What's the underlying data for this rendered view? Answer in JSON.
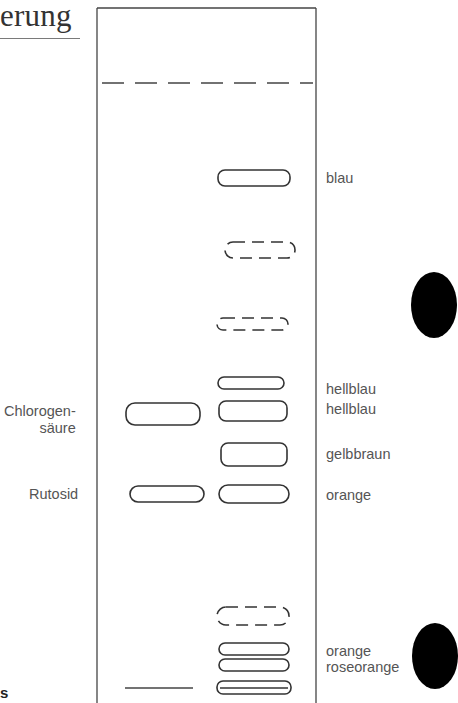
{
  "heading": {
    "text": "erung"
  },
  "footnote": {
    "text": "s"
  },
  "plate": {
    "border_color": "#444444",
    "solvent_front": "dashed",
    "start_line": "solid"
  },
  "reference_labels": [
    {
      "text": "Chlorogen-",
      "line2": "säure"
    },
    {
      "text": "Rutosid"
    }
  ],
  "zone_labels": [
    {
      "text": "blau"
    },
    {
      "text": "hellblau"
    },
    {
      "text": "hellblau"
    },
    {
      "text": "gelbbraun"
    },
    {
      "text": "orange"
    },
    {
      "text": "orange"
    },
    {
      "text": "roseorange"
    }
  ],
  "lanes": {
    "reference": {
      "spots": [
        {
          "name": "chlorogensaeure",
          "style": "solid"
        },
        {
          "name": "rutosid",
          "style": "solid"
        }
      ]
    },
    "sample": {
      "spots": [
        {
          "label": "blau",
          "style": "solid"
        },
        {
          "label": "",
          "style": "dashed"
        },
        {
          "label": "",
          "style": "dashed"
        },
        {
          "label": "hellblau",
          "style": "solid"
        },
        {
          "label": "hellblau",
          "style": "solid"
        },
        {
          "label": "gelbbraun",
          "style": "solid"
        },
        {
          "label": "orange",
          "style": "solid"
        },
        {
          "label": "",
          "style": "dashed"
        },
        {
          "label": "orange",
          "style": "solid"
        },
        {
          "label": "roseorange",
          "style": "solid"
        },
        {
          "label": "",
          "style": "solid-double"
        }
      ]
    }
  },
  "colors": {
    "ink": "#444444",
    "text": "#555555",
    "tab": "#000000"
  }
}
